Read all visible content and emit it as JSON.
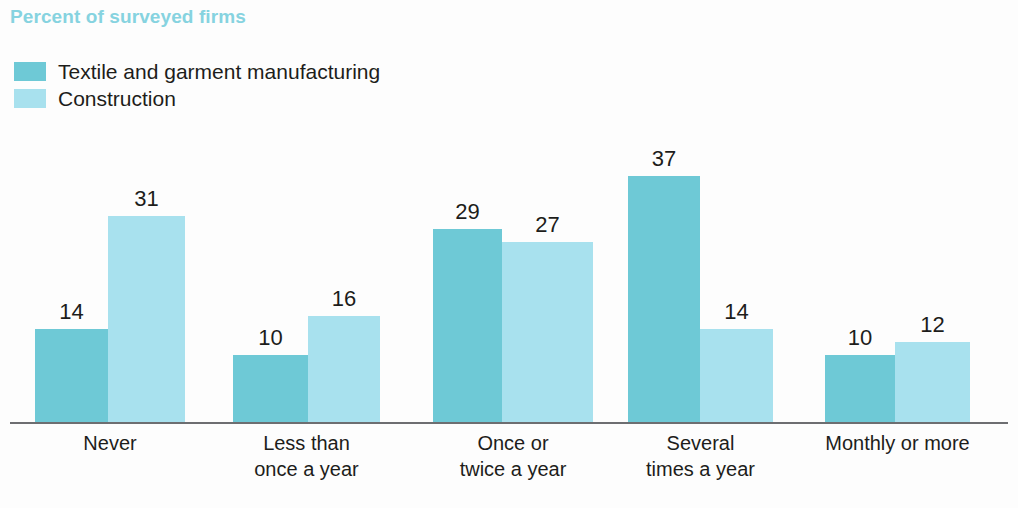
{
  "chart_data": {
    "type": "bar",
    "title": "Percent of surveyed firms",
    "xlabel": "",
    "ylabel": "",
    "ylim": [
      0,
      40
    ],
    "grid": false,
    "legend_position": "top-left",
    "orientation": "vertical",
    "grouping": "grouped",
    "categories": [
      "Never",
      "Less than once a year",
      "Once or twice a year",
      "Several times a year",
      "Monthly or more"
    ],
    "category_lines": [
      [
        "Never"
      ],
      [
        "Less than",
        "once a year"
      ],
      [
        "Once or",
        "twice a year"
      ],
      [
        "Several",
        "times a year"
      ],
      [
        "Monthly or more"
      ]
    ],
    "series": [
      {
        "name": "Textile and garment manufacturing",
        "color": "#6ec9d6",
        "values": [
          14,
          10,
          29,
          37,
          10
        ]
      },
      {
        "name": "Construction",
        "color": "#a8e1ee",
        "values": [
          31,
          16,
          27,
          14,
          12
        ]
      }
    ],
    "value_labels": [
      [
        "14",
        "31"
      ],
      [
        "10",
        "16"
      ],
      [
        "29",
        "27"
      ],
      [
        "37",
        "14"
      ],
      [
        "10",
        "12"
      ]
    ],
    "title_color": "#86d3e0",
    "axis_color": "#6d6e71",
    "label_color": "#1d1d1b"
  },
  "layout": {
    "baseline_y": 422,
    "px_per_unit": 6.65,
    "groups": [
      {
        "x0": 35,
        "x1": 108,
        "x2": 185
      },
      {
        "x0": 233,
        "x1": 308,
        "x2": 380
      },
      {
        "x0": 433,
        "x1": 502,
        "x2": 593
      },
      {
        "x0": 628,
        "x1": 700,
        "x2": 773
      },
      {
        "x0": 825,
        "x1": 895,
        "x2": 970
      }
    ]
  }
}
